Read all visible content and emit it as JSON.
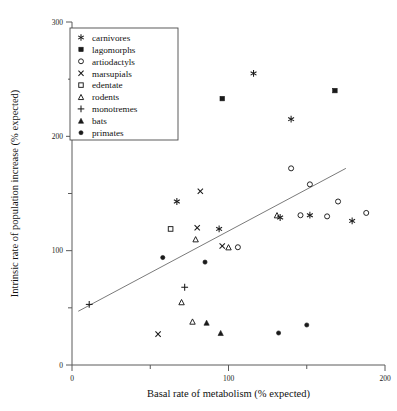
{
  "chart_data": {
    "type": "scatter",
    "title": "",
    "xlabel": "Basal rate of metabolism (% expected)",
    "ylabel": "Intrinsic rate of population increase (% expected)",
    "xlim": [
      0,
      200
    ],
    "ylim": [
      0,
      300
    ],
    "xticks": [
      0,
      50,
      100,
      150,
      200
    ],
    "xticklabels": [
      "0",
      "",
      "100",
      "",
      "200"
    ],
    "yticks": [
      0,
      50,
      100,
      150,
      200,
      250,
      300
    ],
    "yticklabels": [
      "0",
      "",
      "100",
      "",
      "200",
      "",
      "300"
    ],
    "grid": false,
    "legend_position": "upper-left",
    "trendline": {
      "label": "regression line",
      "x_start": 4,
      "y_start": 47,
      "x_end": 175,
      "y_end": 172
    },
    "series": [
      {
        "name": "carnivores",
        "marker": "asterisk",
        "fill": "solid",
        "points": [
          {
            "x": 116,
            "y": 255
          },
          {
            "x": 140,
            "y": 215
          },
          {
            "x": 67,
            "y": 143
          },
          {
            "x": 94,
            "y": 119
          },
          {
            "x": 133,
            "y": 129
          },
          {
            "x": 152,
            "y": 131
          },
          {
            "x": 179,
            "y": 126
          }
        ]
      },
      {
        "name": "lagomorphs",
        "marker": "filled-square",
        "fill": "solid",
        "points": [
          {
            "x": 96,
            "y": 233
          },
          {
            "x": 168,
            "y": 240
          }
        ]
      },
      {
        "name": "artiodactyls",
        "marker": "open-circle",
        "fill": "open",
        "points": [
          {
            "x": 106,
            "y": 103
          },
          {
            "x": 140,
            "y": 172
          },
          {
            "x": 152,
            "y": 158
          },
          {
            "x": 170,
            "y": 143
          },
          {
            "x": 163,
            "y": 130
          },
          {
            "x": 188,
            "y": 133
          },
          {
            "x": 146,
            "y": 131
          }
        ]
      },
      {
        "name": "marsupials",
        "marker": "x",
        "fill": "open",
        "points": [
          {
            "x": 82,
            "y": 152
          },
          {
            "x": 80,
            "y": 120
          },
          {
            "x": 96,
            "y": 104
          },
          {
            "x": 55,
            "y": 27
          }
        ]
      },
      {
        "name": "edentate",
        "marker": "open-square",
        "fill": "open",
        "points": [
          {
            "x": 63,
            "y": 119
          }
        ]
      },
      {
        "name": "rodents",
        "marker": "open-triangle",
        "fill": "open",
        "points": [
          {
            "x": 79,
            "y": 110
          },
          {
            "x": 100,
            "y": 103
          },
          {
            "x": 131,
            "y": 131
          },
          {
            "x": 70,
            "y": 55
          },
          {
            "x": 77,
            "y": 38
          }
        ]
      },
      {
        "name": "monotremes",
        "marker": "plus",
        "fill": "solid",
        "points": [
          {
            "x": 11,
            "y": 53
          },
          {
            "x": 72,
            "y": 68
          }
        ]
      },
      {
        "name": "bats",
        "marker": "filled-triangle",
        "fill": "solid",
        "points": [
          {
            "x": 86,
            "y": 37
          },
          {
            "x": 95,
            "y": 28
          }
        ]
      },
      {
        "name": "primates",
        "marker": "filled-circle",
        "fill": "solid",
        "points": [
          {
            "x": 58,
            "y": 94
          },
          {
            "x": 85,
            "y": 90
          },
          {
            "x": 132,
            "y": 28
          },
          {
            "x": 150,
            "y": 35
          }
        ]
      }
    ]
  },
  "legend": {
    "entries": [
      {
        "label": "carnivores",
        "marker": "asterisk"
      },
      {
        "label": "lagomorphs",
        "marker": "filled-square"
      },
      {
        "label": "artiodactyls",
        "marker": "open-circle"
      },
      {
        "label": "marsupials",
        "marker": "x"
      },
      {
        "label": "edentate",
        "marker": "open-square"
      },
      {
        "label": "rodents",
        "marker": "open-triangle"
      },
      {
        "label": "monotremes",
        "marker": "plus"
      },
      {
        "label": "bats",
        "marker": "filled-triangle"
      },
      {
        "label": "primates",
        "marker": "filled-circle"
      }
    ]
  },
  "colors": {
    "axis": "#5a5a5a",
    "marker": "#1a1a1a",
    "trendline": "#6b6b6b",
    "background": "#ffffff"
  }
}
